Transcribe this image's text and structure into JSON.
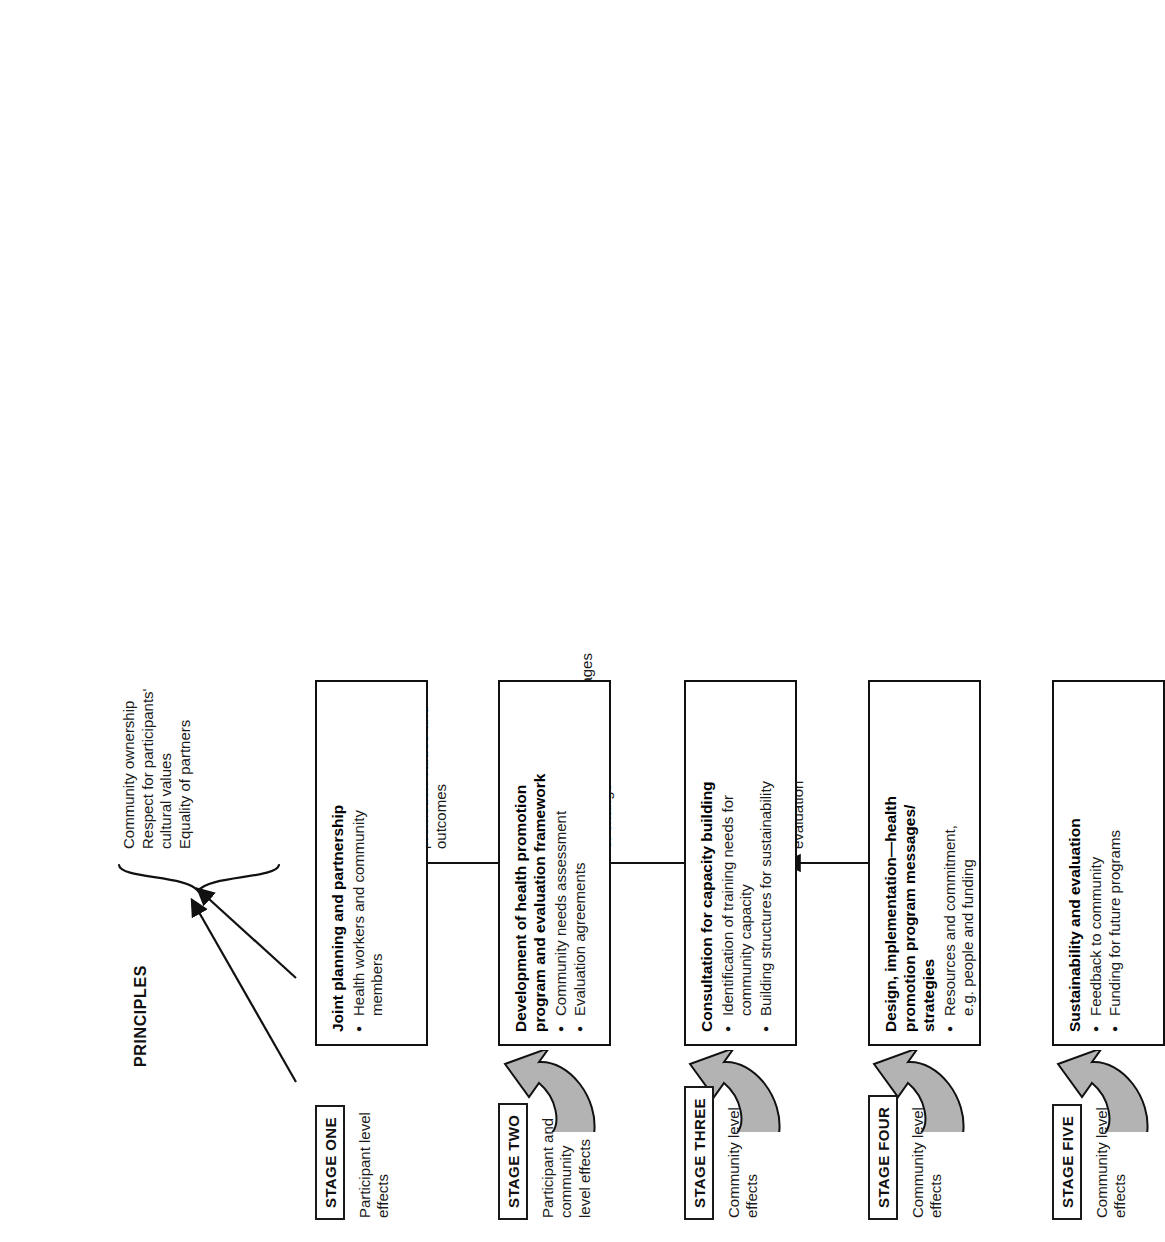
{
  "diagram": {
    "title": "PRINCIPLES",
    "orientation": "rotated-90-ccw",
    "stages": [
      {
        "tag": "STAGE ONE",
        "effects": "Participant level\neffects",
        "box_title": "Joint planning and partnership",
        "bullets": [
          "Health workers and community\nmembers"
        ],
        "principle": "",
        "has_curved_arrow_before": false,
        "arrow_type": "diagonal-to-brace"
      },
      {
        "tag": "STAGE TWO",
        "effects": "Participant and\ncommunity\nlevel effects",
        "box_title": "Development of health promotion\nprogram and evaluation framework",
        "bullets": [
          "Community needs assessment",
          "Evaluation agreements"
        ],
        "principle": "",
        "has_curved_arrow_before": true,
        "arrow_type": "diagonal-to-brace"
      },
      {
        "tag": "STAGE THREE",
        "effects": "Community level\neffects",
        "box_title": "Consultation for capacity building",
        "bullets": [
          "Identification of training needs for\ncommunity capacity",
          "Building structures for sustainability"
        ],
        "principle": "Agreement on health\npromotion values and\noutcomes",
        "has_curved_arrow_before": true,
        "arrow_type": "straight-up"
      },
      {
        "tag": "STAGE FOUR",
        "effects": "Community level\neffects",
        "box_title": "Design, implementation—health\npromotion program messages/\nstrategies",
        "bullets": [
          "Resources and commitment,\ne.g. people and funding"
        ],
        "principle": "Indigenous models for stages\nof change",
        "has_curved_arrow_before": true,
        "arrow_type": "straight-up"
      },
      {
        "tag": "STAGE FIVE",
        "effects": "Community level\neffects",
        "box_title": "Sustainability and evaluation",
        "bullets": [
          "Feedback to community",
          "Funding for future programs"
        ],
        "principle": "Indigenous models of\nevaluation",
        "has_curved_arrow_before": true,
        "arrow_type": "straight-up"
      }
    ],
    "brace_principles": "Community ownership\nRespect for participants'\ncultural values\nEquality of partners",
    "colors": {
      "stroke": "#111111",
      "arrow_fill": "#b3b3b3",
      "text": "#1a1a1a",
      "background": "#ffffff"
    }
  }
}
